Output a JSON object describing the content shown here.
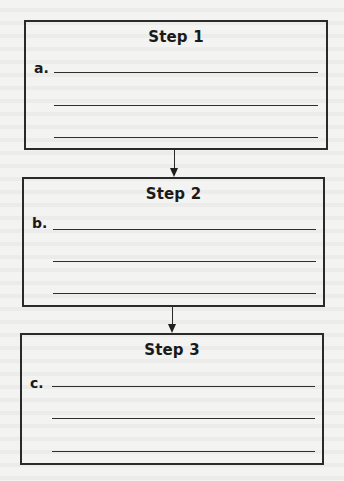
{
  "diagram": {
    "type": "flowchart",
    "direction": "top-to-bottom",
    "steps": [
      {
        "title": "Step 1",
        "label": "a.",
        "blank_lines": 3
      },
      {
        "title": "Step 2",
        "label": "b.",
        "blank_lines": 3
      },
      {
        "title": "Step 3",
        "label": "c.",
        "blank_lines": 3
      }
    ],
    "connectors": [
      {
        "from": "Step 1",
        "to": "Step 2",
        "style": "arrow"
      },
      {
        "from": "Step 2",
        "to": "Step 3",
        "style": "arrow"
      }
    ]
  },
  "colors": {
    "background": "#f3f3f1",
    "stroke": "#2a2a2a",
    "text": "#1a1a1a"
  }
}
